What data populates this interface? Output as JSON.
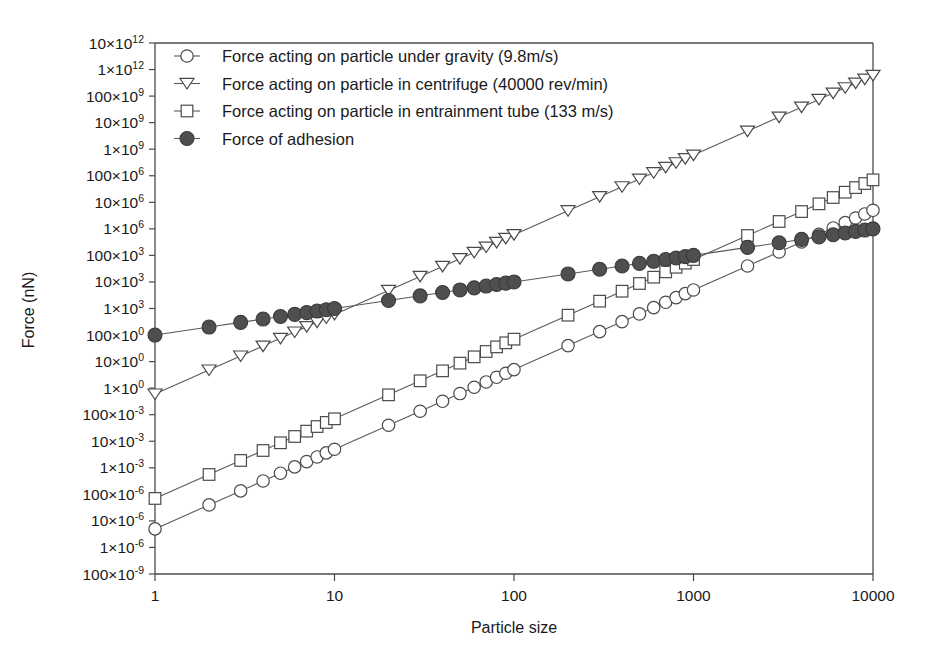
{
  "chart_data": {
    "type": "line",
    "title": "",
    "xlabel": "Particle size",
    "ylabel": "Force (nN)",
    "xscale": "log",
    "yscale": "log",
    "xlim": [
      1,
      10000
    ],
    "ylim": [
      1e-07,
      10000000000000.0
    ],
    "grid": false,
    "legend_position": "top-left inside plot",
    "x_ticks": [
      "1",
      "10",
      "100",
      "1000",
      "10000"
    ],
    "x_tick_values": [
      1,
      10,
      100,
      1000,
      10000
    ],
    "y_ticks": [
      "10×10¹²",
      "1×10¹²",
      "100×10⁹",
      "10×10⁹",
      "1×10⁹",
      "100×10⁶",
      "10×10⁶",
      "1×10⁶",
      "100×10³",
      "10×10³",
      "1×10³",
      "100×10⁰",
      "10×10⁰",
      "1×10⁰",
      "100×10⁻³",
      "10×10⁻³",
      "1×10⁻³",
      "100×10⁻⁶",
      "10×10⁻⁶",
      "1×10⁻⁶",
      "100×10⁻⁹"
    ],
    "y_tick_mantissas": [
      "10",
      "1",
      "100",
      "10",
      "1",
      "100",
      "10",
      "1",
      "100",
      "10",
      "1",
      "100",
      "10",
      "1",
      "100",
      "10",
      "1",
      "100",
      "10",
      "1",
      "100"
    ],
    "y_tick_exponents": [
      "12",
      "12",
      "9",
      "9",
      "9",
      "6",
      "6",
      "6",
      "3",
      "3",
      "3",
      "0",
      "0",
      "0",
      "-3",
      "-3",
      "-3",
      "-6",
      "-6",
      "-6",
      "-9"
    ],
    "y_tick_values": [
      10000000000000.0,
      1000000000000.0,
      100000000000.0,
      10000000000.0,
      1000000000.0,
      100000000.0,
      10000000.0,
      1000000.0,
      100000.0,
      10000.0,
      1000.0,
      100.0,
      10.0,
      1.0,
      0.1,
      0.01,
      0.001,
      0.0001,
      1e-05,
      1e-06,
      1e-07
    ],
    "x": [
      1,
      2,
      3,
      4,
      5,
      6,
      7,
      8,
      9,
      10,
      20,
      30,
      40,
      50,
      60,
      70,
      80,
      90,
      100,
      200,
      300,
      400,
      500,
      600,
      700,
      800,
      900,
      1000,
      2000,
      3000,
      4000,
      5000,
      6000,
      7000,
      8000,
      9000,
      10000
    ],
    "series": [
      {
        "name": "Force acting on particle under gravity (9.8m/s)",
        "marker": "open-circle",
        "slope_exponent": 3,
        "values": [
          5e-06,
          4e-05,
          0.000135,
          0.00032,
          0.000625,
          0.00108,
          0.001715,
          0.00256,
          0.003645,
          0.005,
          0.04,
          0.135,
          0.32,
          0.625,
          1.08,
          1.715,
          2.56,
          3.645,
          5.0,
          40.0,
          135.0,
          320.0,
          625.0,
          1080.0,
          1715.0,
          2560.0,
          3645.0,
          5000.0,
          40000.0,
          135000.0,
          320000.0,
          625000.0,
          1080000.0,
          1715000.0,
          2560000.0,
          3645000.0,
          5000000.0
        ]
      },
      {
        "name": "Force acting on particle in centrifuge (40000 rev/min)",
        "marker": "open-triangle-down",
        "slope_exponent": 3,
        "values": [
          0.6,
          4.8,
          16.2,
          38.4,
          75.0,
          129.6,
          205.8,
          307.2,
          437.4,
          600.0,
          4800.0,
          16200.0,
          38400.0,
          75000.0,
          129600.0,
          205800.0,
          307200.0,
          437400.0,
          600000.0,
          4800000.0,
          16200000.0,
          38400000.0,
          75000000.0,
          129600000.0,
          205800000.0,
          307200000.0,
          437400000.0,
          600000000.0,
          4800000000.0,
          16200000000.0,
          38400000000.0,
          75000000000.0,
          129600000000.0,
          205800000000.0,
          307200000000.0,
          437400000000.0,
          600000000000.0
        ]
      },
      {
        "name": "Force acting on particle in entrainment tube (133 m/s)",
        "marker": "open-square",
        "slope_exponent": 3,
        "values": [
          7e-05,
          0.00056,
          0.00189,
          0.00448,
          0.00875,
          0.01512,
          0.02401,
          0.03584,
          0.05103,
          0.07,
          0.56,
          1.89,
          4.48,
          8.75,
          15.12,
          24.01,
          35.84,
          51.03,
          70.0,
          560.0,
          1890.0,
          4480.0,
          8750.0,
          15120.0,
          24010.0,
          35840.0,
          51030.0,
          70000.0,
          560000.0,
          1890000.0,
          4480000.0,
          8750000.0,
          15120000.0,
          24010000.0,
          35840000.0,
          51030000.0,
          70000000.0
        ]
      },
      {
        "name": "Force of adhesion",
        "marker": "filled-circle",
        "slope_exponent": 1,
        "values": [
          100.0,
          200.0,
          300.0,
          400.0,
          500.0,
          600.0,
          700.0,
          800.0,
          900.0,
          1000.0,
          2000.0,
          3000.0,
          4000.0,
          5000.0,
          6000.0,
          7000.0,
          8000.0,
          9000.0,
          10000.0,
          20000.0,
          30000.0,
          40000.0,
          50000.0,
          60000.0,
          70000.0,
          80000.0,
          90000.0,
          100000.0,
          200000.0,
          300000.0,
          400000.0,
          500000.0,
          600000.0,
          700000.0,
          800000.0,
          900000.0,
          1000000.0
        ]
      }
    ]
  },
  "legend": {
    "entries": [
      {
        "label": "Force acting on particle under gravity (9.8m/s)",
        "marker": "open-circle"
      },
      {
        "label": "Force acting on particle in centrifuge (40000 rev/min)",
        "marker": "open-triangle-down"
      },
      {
        "label": "Force acting on particle in entrainment tube (133 m/s)",
        "marker": "open-square"
      },
      {
        "label": "Force of adhesion",
        "marker": "filled-circle"
      }
    ]
  },
  "colors": {
    "axis": "#4a4a4a",
    "line": "#5a5a5a",
    "marker_fill_open": "#ffffff",
    "marker_fill_solid": "#4f4f4f",
    "background": "#ffffff",
    "text": "#1a1a1a"
  }
}
